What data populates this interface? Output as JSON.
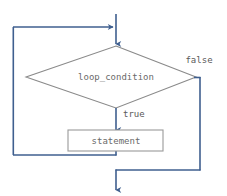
{
  "diagram": {
    "type": "flowchart",
    "colors": {
      "connector": "#3f5f8f",
      "shape_outline": "#8a8a8a",
      "box_outline": "#9a9a9a",
      "label_text": "#5a5a5a",
      "node_text": "#6a6a6a",
      "background": "#ffffff"
    },
    "nodes": [
      {
        "id": "decision",
        "shape": "diamond",
        "label": "loop_condition"
      },
      {
        "id": "process",
        "shape": "rectangle",
        "label": "statement"
      }
    ],
    "edge_labels": {
      "false": "false",
      "true": "true"
    }
  }
}
